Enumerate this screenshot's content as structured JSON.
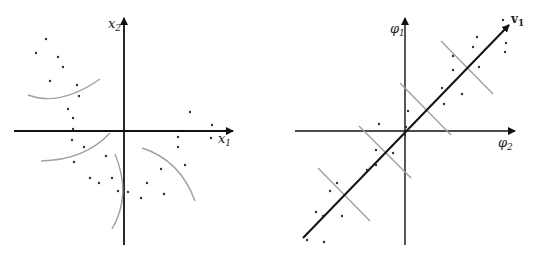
{
  "left_panel": {
    "x_axis_label": "x",
    "x_axis_sub": "1",
    "y_axis_label": "x",
    "y_axis_sub": "2",
    "description": "Data points in original space with curved (nonlinear) contour arcs"
  },
  "right_panel": {
    "x_axis_label": "φ",
    "x_axis_sub": "2",
    "y_axis_label": "φ",
    "y_axis_sub": "1",
    "vector_label": "v",
    "vector_sub": "1",
    "description": "Points in feature space along principal direction v1 with perpendicular contour lines"
  },
  "colors": {
    "axis": "#111111",
    "contour": "#a0a0a0",
    "point": "#333333"
  }
}
